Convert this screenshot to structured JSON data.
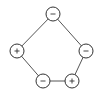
{
  "diagram": {
    "type": "signed-cycle-graph",
    "nodes": [
      {
        "id": "top",
        "sign": "-",
        "x": 53,
        "y": 14
      },
      {
        "id": "right",
        "sign": "-",
        "x": 86,
        "y": 51
      },
      {
        "id": "bottom-right",
        "sign": "+",
        "x": 72,
        "y": 81
      },
      {
        "id": "bottom-left",
        "sign": "-",
        "x": 43,
        "y": 81
      },
      {
        "id": "left",
        "sign": "+",
        "x": 17,
        "y": 51
      }
    ],
    "edges": [
      [
        "top",
        "right"
      ],
      [
        "right",
        "bottom-right"
      ],
      [
        "bottom-right",
        "bottom-left"
      ],
      [
        "bottom-left",
        "left"
      ],
      [
        "left",
        "top"
      ]
    ],
    "node_radius": 7,
    "colors": {
      "stroke": "#333333",
      "edge": "#555555",
      "fill": "#ffffff"
    }
  }
}
